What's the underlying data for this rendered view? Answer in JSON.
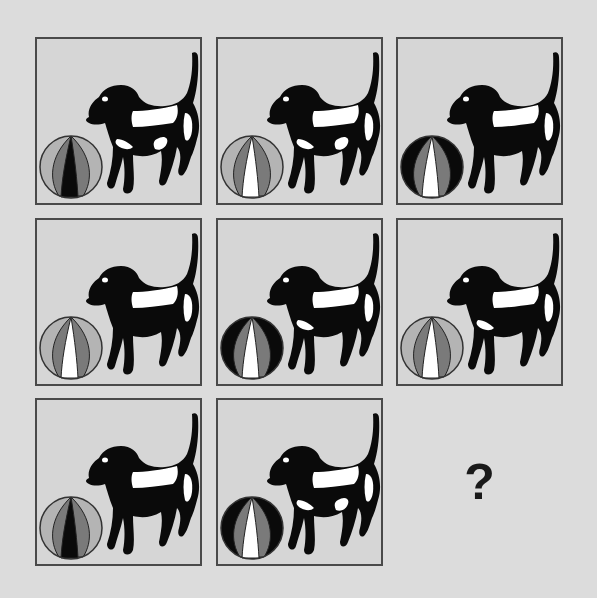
{
  "puzzle": {
    "rows": 3,
    "cols": 3,
    "colors": {
      "background": "#dcdcdc",
      "cell_fill": "#d6d6d6",
      "border": "#4a4a4a",
      "black": "#0a0a0a",
      "white": "#ffffff",
      "light_grey": "#b4b4b4",
      "mid_grey": "#7a7a7a"
    },
    "cells": [
      {
        "row": 1,
        "col": 1,
        "subject": "dog-with-ball",
        "dog_spots": [
          "back",
          "rear",
          "front-leg",
          "belly"
        ],
        "ball": {
          "outer": "light_grey",
          "middle": "mid_grey",
          "center": "black"
        }
      },
      {
        "row": 1,
        "col": 2,
        "subject": "dog-with-ball",
        "dog_spots": [
          "back",
          "rear",
          "front-leg",
          "belly"
        ],
        "ball": {
          "outer": "light_grey",
          "middle": "mid_grey",
          "center": "white"
        }
      },
      {
        "row": 1,
        "col": 3,
        "subject": "dog-with-ball",
        "dog_spots": [
          "back",
          "rear"
        ],
        "ball": {
          "outer": "black",
          "middle": "mid_grey",
          "center": "white"
        }
      },
      {
        "row": 2,
        "col": 1,
        "subject": "dog-with-ball",
        "dog_spots": [
          "back",
          "rear"
        ],
        "ball": {
          "outer": "light_grey",
          "middle": "mid_grey",
          "center": "white"
        }
      },
      {
        "row": 2,
        "col": 2,
        "subject": "dog-with-ball",
        "dog_spots": [
          "back",
          "rear",
          "front-leg"
        ],
        "ball": {
          "outer": "black",
          "middle": "mid_grey",
          "center": "white"
        }
      },
      {
        "row": 2,
        "col": 3,
        "subject": "dog-with-ball",
        "dog_spots": [
          "back",
          "rear",
          "front-leg"
        ],
        "ball": {
          "outer": "light_grey",
          "middle": "mid_grey",
          "center": "white"
        }
      },
      {
        "row": 3,
        "col": 1,
        "subject": "dog-with-ball",
        "dog_spots": [
          "back",
          "rear"
        ],
        "ball": {
          "outer": "light_grey",
          "middle": "mid_grey",
          "center": "black"
        }
      },
      {
        "row": 3,
        "col": 2,
        "subject": "dog-with-ball",
        "dog_spots": [
          "back",
          "rear",
          "front-leg",
          "belly"
        ],
        "ball": {
          "outer": "black",
          "middle": "mid_grey",
          "center": "white"
        }
      }
    ],
    "missing_cell": {
      "row": 3,
      "col": 3,
      "label": "?"
    }
  }
}
